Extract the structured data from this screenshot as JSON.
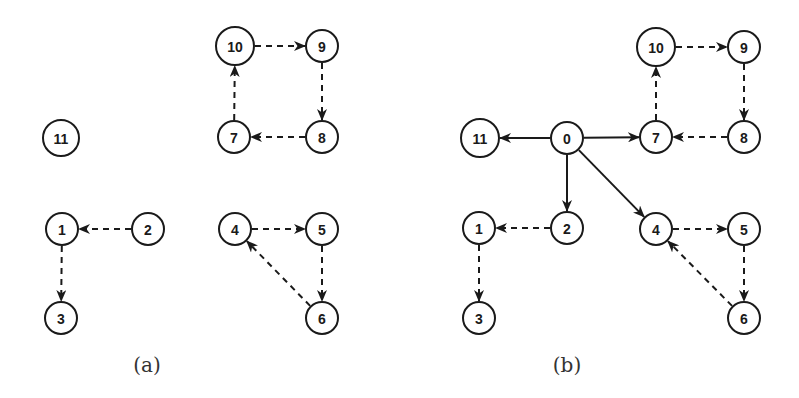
{
  "colors": {
    "stroke": "#1a1a1a",
    "background": "#ffffff",
    "caption": "#333333"
  },
  "panels": [
    {
      "id": "a",
      "caption": "(a)",
      "caption_pos": [
        147,
        365
      ],
      "nodes": [
        {
          "id": "10",
          "label": "10",
          "x": 235,
          "y": 46,
          "r": 19
        },
        {
          "id": "9",
          "label": "9",
          "x": 322,
          "y": 46,
          "r": 16
        },
        {
          "id": "11",
          "label": "11",
          "x": 61,
          "y": 138,
          "r": 18
        },
        {
          "id": "7",
          "label": "7",
          "x": 234,
          "y": 137,
          "r": 16
        },
        {
          "id": "8",
          "label": "8",
          "x": 322,
          "y": 137,
          "r": 16
        },
        {
          "id": "1",
          "label": "1",
          "x": 62,
          "y": 229,
          "r": 16
        },
        {
          "id": "2",
          "label": "2",
          "x": 148,
          "y": 229,
          "r": 16
        },
        {
          "id": "4",
          "label": "4",
          "x": 235,
          "y": 229,
          "r": 16
        },
        {
          "id": "5",
          "label": "5",
          "x": 322,
          "y": 229,
          "r": 16
        },
        {
          "id": "3",
          "label": "3",
          "x": 61,
          "y": 318,
          "r": 16
        },
        {
          "id": "6",
          "label": "6",
          "x": 322,
          "y": 318,
          "r": 16
        }
      ],
      "edges": [
        {
          "from": "10",
          "to": "9",
          "style": "dashed"
        },
        {
          "from": "9",
          "to": "8",
          "style": "dashed"
        },
        {
          "from": "8",
          "to": "7",
          "style": "dashed"
        },
        {
          "from": "7",
          "to": "10",
          "style": "dashed"
        },
        {
          "from": "2",
          "to": "1",
          "style": "dashed"
        },
        {
          "from": "1",
          "to": "3",
          "style": "dashed"
        },
        {
          "from": "4",
          "to": "5",
          "style": "dashed"
        },
        {
          "from": "5",
          "to": "6",
          "style": "dashed"
        },
        {
          "from": "6",
          "to": "4",
          "style": "dashed"
        }
      ]
    },
    {
      "id": "b",
      "caption": "(b)",
      "caption_pos": [
        567,
        365
      ],
      "nodes": [
        {
          "id": "10",
          "label": "10",
          "x": 656,
          "y": 47,
          "r": 19
        },
        {
          "id": "9",
          "label": "9",
          "x": 744,
          "y": 47,
          "r": 16
        },
        {
          "id": "11",
          "label": "11",
          "x": 480,
          "y": 138,
          "r": 19
        },
        {
          "id": "0",
          "label": "0",
          "x": 567,
          "y": 138,
          "r": 16
        },
        {
          "id": "7",
          "label": "7",
          "x": 656,
          "y": 137,
          "r": 16
        },
        {
          "id": "8",
          "label": "8",
          "x": 744,
          "y": 137,
          "r": 16
        },
        {
          "id": "1",
          "label": "1",
          "x": 479,
          "y": 228,
          "r": 16
        },
        {
          "id": "2",
          "label": "2",
          "x": 567,
          "y": 228,
          "r": 16
        },
        {
          "id": "4",
          "label": "4",
          "x": 656,
          "y": 229,
          "r": 16
        },
        {
          "id": "5",
          "label": "5",
          "x": 744,
          "y": 229,
          "r": 16
        },
        {
          "id": "3",
          "label": "3",
          "x": 479,
          "y": 318,
          "r": 16
        },
        {
          "id": "6",
          "label": "6",
          "x": 744,
          "y": 318,
          "r": 16
        }
      ],
      "edges": [
        {
          "from": "0",
          "to": "11",
          "style": "solid"
        },
        {
          "from": "0",
          "to": "7",
          "style": "solid"
        },
        {
          "from": "0",
          "to": "2",
          "style": "solid"
        },
        {
          "from": "0",
          "to": "4",
          "style": "solid"
        },
        {
          "from": "10",
          "to": "9",
          "style": "dashed"
        },
        {
          "from": "9",
          "to": "8",
          "style": "dashed"
        },
        {
          "from": "8",
          "to": "7",
          "style": "dashed"
        },
        {
          "from": "7",
          "to": "10",
          "style": "dashed"
        },
        {
          "from": "2",
          "to": "1",
          "style": "dashed"
        },
        {
          "from": "1",
          "to": "3",
          "style": "dashed"
        },
        {
          "from": "4",
          "to": "5",
          "style": "dashed"
        },
        {
          "from": "5",
          "to": "6",
          "style": "dashed"
        },
        {
          "from": "6",
          "to": "4",
          "style": "dashed"
        }
      ]
    }
  ]
}
